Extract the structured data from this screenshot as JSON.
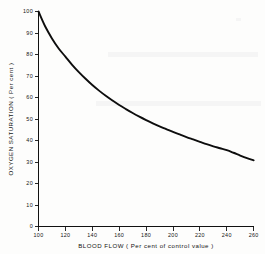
{
  "chart_data": {
    "type": "line",
    "title": "",
    "xlabel": "BLOOD  FLOW  ( Per cent of control value )",
    "ylabel": "OXYGEN  SATURATION  ( Per cent )",
    "xlim": [
      100,
      260
    ],
    "ylim": [
      0,
      100
    ],
    "grid": false,
    "legend": null,
    "x_ticks": [
      100,
      120,
      140,
      160,
      180,
      200,
      220,
      240,
      260
    ],
    "x_tick_labels": [
      "100",
      "120",
      "140",
      "160",
      "180",
      "200",
      "220",
      "240",
      "260"
    ],
    "y_ticks": [
      0,
      10,
      20,
      30,
      40,
      50,
      60,
      70,
      80,
      90,
      100
    ],
    "y_tick_labels": [
      "0",
      "10",
      "20",
      "30",
      "40",
      "50",
      "60",
      "70",
      "80",
      "90",
      "100"
    ],
    "x": [
      100,
      105,
      110,
      115,
      120,
      125,
      130,
      135,
      140,
      145,
      150,
      155,
      160,
      165,
      170,
      175,
      180,
      185,
      190,
      195,
      200,
      205,
      210,
      215,
      220,
      225,
      230,
      235,
      240,
      245,
      250,
      255,
      260
    ],
    "values": [
      100,
      93,
      87.5,
      82.8,
      79,
      75.2,
      71.8,
      68.7,
      65.8,
      63.2,
      60.8,
      58.6,
      56.5,
      54.6,
      52.8,
      51.1,
      49.5,
      48.0,
      46.6,
      45.3,
      44.0,
      42.8,
      41.6,
      40.5,
      39.4,
      38.3,
      37.3,
      36.4,
      35.5,
      34.3,
      33.0,
      31.8,
      30.8
    ],
    "series": [
      {
        "name": "Oxygen saturation",
        "values": [
          100,
          93,
          87.5,
          82.8,
          79,
          75.2,
          71.8,
          68.7,
          65.8,
          63.2,
          60.8,
          58.6,
          56.5,
          54.6,
          52.8,
          51.1,
          49.5,
          48.0,
          46.6,
          45.3,
          44.0,
          42.8,
          41.6,
          40.5,
          39.4,
          38.3,
          37.3,
          36.4,
          35.5,
          34.3,
          33.0,
          31.8,
          30.8
        ],
        "color": "#0d0d0d"
      }
    ]
  },
  "figure": {
    "background_color": "#fdfdfc",
    "axis_color": "#111111",
    "curve_color": "#0d0d0d"
  }
}
